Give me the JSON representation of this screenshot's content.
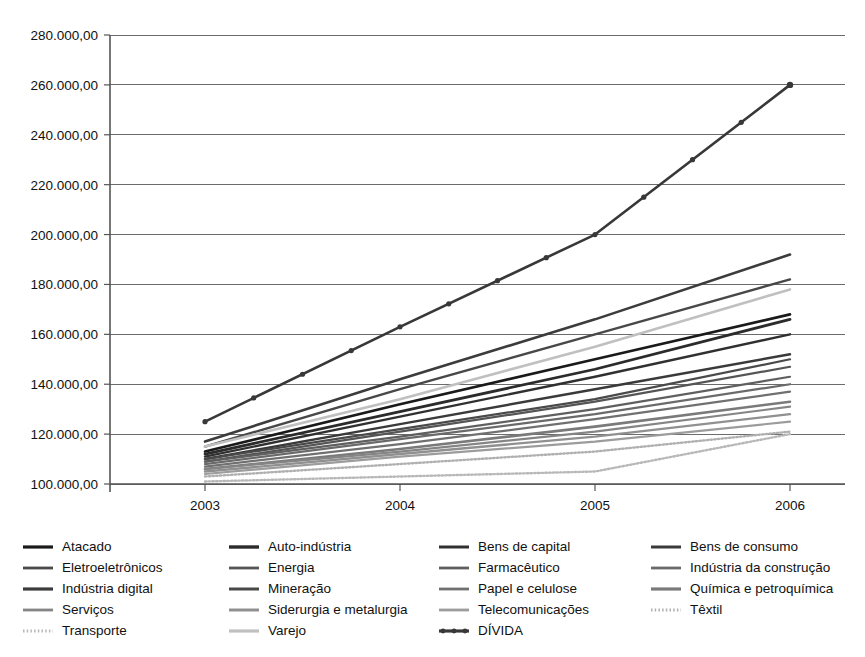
{
  "chart_data": {
    "type": "line",
    "title": "",
    "subtitle": "",
    "xlabel": "",
    "ylabel": "",
    "x": [
      "2003",
      "2004",
      "2005",
      "2006"
    ],
    "categories": [
      "2003",
      "2004",
      "2005",
      "2006"
    ],
    "xtick_labels": [
      "2003",
      "2004",
      "2005",
      "2006"
    ],
    "ytick_labels": [
      "280.000,00",
      "260.000,00",
      "240.000,00",
      "220.000,00",
      "200.000,00",
      "180.000,00",
      "160.000,00",
      "140.000,00",
      "120.000,00",
      "100.000,00"
    ],
    "ytick_values": [
      280000,
      260000,
      240000,
      220000,
      200000,
      180000,
      160000,
      140000,
      120000,
      100000
    ],
    "ylim": [
      100000,
      280000
    ],
    "ytick_step": 20000,
    "grid": true,
    "grid_axis": "y",
    "legend_position": "bottom",
    "legend_columns": 4,
    "series": [
      {
        "name": "Atacado",
        "values": [
          113000,
          132000,
          150000,
          168000
        ],
        "color": "#1a1a1a",
        "style": "solid",
        "width": 2.6,
        "markers": false
      },
      {
        "name": "Auto-indústria",
        "values": [
          112000,
          129000,
          146000,
          166000
        ],
        "color": "#2b2b2b",
        "style": "solid",
        "width": 2.8,
        "markers": false
      },
      {
        "name": "Bens de capital",
        "values": [
          111000,
          127000,
          143000,
          160000
        ],
        "color": "#303030",
        "style": "solid",
        "width": 2.4,
        "markers": false
      },
      {
        "name": "Bens de consumo",
        "values": [
          110000,
          124000,
          138000,
          152000
        ],
        "color": "#3a3a3a",
        "style": "solid",
        "width": 2.4,
        "markers": false
      },
      {
        "name": "Eletroeletrônicos",
        "values": [
          110000,
          122000,
          134000,
          150000
        ],
        "color": "#4a4a4a",
        "style": "solid",
        "width": 2.2,
        "markers": false
      },
      {
        "name": "Energia",
        "values": [
          109000,
          121000,
          133000,
          147000
        ],
        "color": "#555555",
        "style": "solid",
        "width": 2.2,
        "markers": false
      },
      {
        "name": "Farmacêutico",
        "values": [
          109000,
          119000,
          130000,
          143000
        ],
        "color": "#5f5f5f",
        "style": "solid",
        "width": 2.2,
        "markers": false
      },
      {
        "name": "Indústria da construção",
        "values": [
          108000,
          118000,
          128000,
          140000
        ],
        "color": "#6a6a6a",
        "style": "solid",
        "width": 2.2,
        "markers": false
      },
      {
        "name": "Indústria digital",
        "values": [
          117000,
          142000,
          166000,
          192000
        ],
        "color": "#3c3c3c",
        "style": "solid",
        "width": 2.6,
        "markers": false
      },
      {
        "name": "Mineração",
        "values": [
          115000,
          138000,
          160000,
          182000
        ],
        "color": "#484848",
        "style": "solid",
        "width": 2.4,
        "markers": false
      },
      {
        "name": "Papel e celulose",
        "values": [
          107000,
          116000,
          126000,
          137000
        ],
        "color": "#707070",
        "style": "solid",
        "width": 2.2,
        "markers": false
      },
      {
        "name": "Química e petroquímica",
        "values": [
          106000,
          114000,
          123000,
          133000
        ],
        "color": "#7a7a7a",
        "style": "solid",
        "width": 2.6,
        "markers": false
      },
      {
        "name": "Serviços",
        "values": [
          106000,
          113000,
          121000,
          131000
        ],
        "color": "#858585",
        "style": "solid",
        "width": 2.2,
        "markers": false
      },
      {
        "name": "Siderurgia e metalurgia",
        "values": [
          105000,
          112000,
          119000,
          128000
        ],
        "color": "#909090",
        "style": "solid",
        "width": 2.4,
        "markers": false
      },
      {
        "name": "Telecomunicações",
        "values": [
          104000,
          111000,
          117000,
          125000
        ],
        "color": "#9c9c9c",
        "style": "solid",
        "width": 2.2,
        "markers": false
      },
      {
        "name": "Têxtil",
        "values": [
          103000,
          108000,
          113000,
          121000
        ],
        "color": "#b0b0b0",
        "style": "dotted",
        "width": 2.4,
        "markers": false
      },
      {
        "name": "Transporte",
        "values": [
          101000,
          103000,
          105000,
          120000
        ],
        "color": "#b8b8b8",
        "style": "dotted",
        "width": 2.4,
        "markers": false
      },
      {
        "name": "Varejo",
        "values": [
          115000,
          134000,
          155000,
          178000
        ],
        "color": "#c0c0c0",
        "style": "solid",
        "width": 2.6,
        "markers": false
      },
      {
        "name": "DÍVIDA",
        "values": [
          125000,
          163000,
          200000,
          260000
        ],
        "color": "#383838",
        "style": "solid",
        "width": 2.6,
        "markers": true
      }
    ],
    "highlight_series": "DÍVIDA"
  },
  "legend": {
    "columns": [
      [
        {
          "label": "Atacado",
          "series": "Atacado"
        },
        {
          "label": "Eletroeletrônicos",
          "series": "Eletroeletrônicos"
        },
        {
          "label": "Indústria digital",
          "series": "Indústria digital"
        },
        {
          "label": "Serviços",
          "series": "Serviços"
        },
        {
          "label": "Transporte",
          "series": "Transporte"
        }
      ],
      [
        {
          "label": "Auto-indústria",
          "series": "Auto-indústria"
        },
        {
          "label": "Energia",
          "series": "Energia"
        },
        {
          "label": "Mineração",
          "series": "Mineração"
        },
        {
          "label": "Siderurgia e metalurgia",
          "series": "Siderurgia e metalurgia"
        },
        {
          "label": "Varejo",
          "series": "Varejo"
        }
      ],
      [
        {
          "label": "Bens de capital",
          "series": "Bens de capital"
        },
        {
          "label": "Farmacêutico",
          "series": "Farmacêutico"
        },
        {
          "label": "Papel e celulose",
          "series": "Papel e celulose"
        },
        {
          "label": "Telecomunicações",
          "series": "Telecomunicações"
        },
        {
          "label": "DÍVIDA",
          "series": "DÍVIDA"
        }
      ],
      [
        {
          "label": "Bens de consumo",
          "series": "Bens de consumo"
        },
        {
          "label": "Indústria da construção",
          "series": "Indústria da construção"
        },
        {
          "label": "Química e petroquímica",
          "series": "Química e petroquímica"
        },
        {
          "label": "Têxtil",
          "series": "Têxtil"
        }
      ]
    ]
  },
  "colors": {
    "axis": "#555555",
    "grid": "#6b6b6b",
    "background": "#ffffff",
    "text": "#111111",
    "highlight": "#383838"
  }
}
